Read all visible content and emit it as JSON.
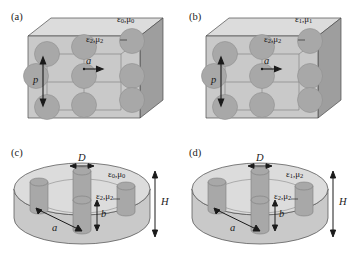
{
  "figure": {
    "type": "schematic-diagram",
    "panel_count": 4,
    "colors": {
      "background": "#ffffff",
      "host_front": "#c9c9c9",
      "host_top": "#dcdcdc",
      "host_side": "#9e9e9e",
      "inclusion": "#a8a8a8",
      "inclusion_shade": "#8d8d8d",
      "outline": "#4a4a4a",
      "text": "#1a1a1a"
    }
  },
  "panels": [
    {
      "id": "a",
      "tag": "(a)",
      "geometry": "cube-with-sphere-array",
      "host_label": {
        "eps": "ε",
        "eps_sub": "0",
        "mu": "μ",
        "mu_sub": "0"
      },
      "inclusion_label": {
        "eps": "ε",
        "eps_sub": "2",
        "mu": "μ",
        "mu_sub": "2"
      },
      "dimensions": [
        {
          "name": "p",
          "symbol": "p",
          "meaning": "lattice period",
          "arrow": "vertical-double"
        },
        {
          "name": "a",
          "symbol": "a",
          "meaning": "sphere radius",
          "arrow": "horizontal-single"
        }
      ],
      "inclusion_count": 9,
      "inclusion_shape": "sphere"
    },
    {
      "id": "b",
      "tag": "(b)",
      "geometry": "cube-with-sphere-array",
      "host_label": {
        "eps": "ε",
        "eps_sub": "1",
        "mu": "μ",
        "mu_sub": "1"
      },
      "inclusion_label": {
        "eps": "ε",
        "eps_sub": "2",
        "mu": "μ",
        "mu_sub": "2"
      },
      "dimensions": [
        {
          "name": "p",
          "symbol": "p",
          "meaning": "lattice period",
          "arrow": "vertical-double"
        },
        {
          "name": "a",
          "symbol": "a",
          "meaning": "sphere radius",
          "arrow": "horizontal-single"
        }
      ],
      "inclusion_count": 9,
      "inclusion_shape": "sphere"
    },
    {
      "id": "c",
      "tag": "(c)",
      "geometry": "disk-with-rod-array",
      "host_label": {
        "eps": "ε",
        "eps_sub": "0",
        "mu": "μ",
        "mu_sub": "0"
      },
      "inclusion_label": {
        "eps": "ε",
        "eps_sub": "2",
        "mu": "μ",
        "mu_sub": "2"
      },
      "dimensions": [
        {
          "name": "D",
          "symbol": "D",
          "meaning": "rod diameter",
          "arrow": "horizontal-double"
        },
        {
          "name": "a",
          "symbol": "a",
          "meaning": "rod spacing",
          "arrow": "diagonal-double"
        },
        {
          "name": "b",
          "symbol": "b",
          "meaning": "rod height",
          "arrow": "vertical-double"
        },
        {
          "name": "H",
          "symbol": "H",
          "meaning": "disk thickness",
          "arrow": "vertical-double"
        }
      ],
      "inclusion_count": 4,
      "inclusion_shape": "cylinder"
    },
    {
      "id": "d",
      "tag": "(d)",
      "geometry": "disk-with-rod-array",
      "host_label": {
        "eps": "ε",
        "eps_sub": "1",
        "mu": "μ",
        "mu_sub": "2"
      },
      "inclusion_label": {
        "eps": "ε",
        "eps_sub": "2",
        "mu": "μ",
        "mu_sub": "2"
      },
      "dimensions": [
        {
          "name": "D",
          "symbol": "D",
          "meaning": "rod diameter",
          "arrow": "horizontal-double"
        },
        {
          "name": "a",
          "symbol": "a",
          "meaning": "rod spacing",
          "arrow": "diagonal-double"
        },
        {
          "name": "b",
          "symbol": "b",
          "meaning": "rod height",
          "arrow": "vertical-double"
        },
        {
          "name": "H",
          "symbol": "H",
          "meaning": "disk thickness",
          "arrow": "vertical-double"
        }
      ],
      "inclusion_count": 4,
      "inclusion_shape": "cylinder"
    }
  ]
}
